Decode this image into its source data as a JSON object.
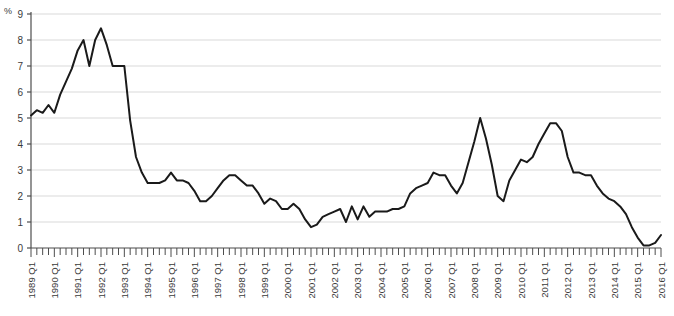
{
  "axis_unit": "%",
  "chart_data": {
    "type": "line",
    "title": "",
    "subtitle": "",
    "xlabel": "",
    "ylabel": "%",
    "ylim": [
      0,
      9
    ],
    "y_ticks": [
      0,
      1,
      2,
      3,
      4,
      5,
      6,
      7,
      8,
      9
    ],
    "grid": true,
    "legend": "none",
    "line_color": "#1a1a1a",
    "grid_color": "#d9d9d9",
    "axis_color": "#4d4d4d",
    "x_tick_labels": [
      "1989 Q1",
      "1990 Q1",
      "1991 Q1",
      "1992 Q1",
      "1993 Q1",
      "1994 Q1",
      "1995 Q1",
      "1996 Q1",
      "1997 Q1",
      "1998 Q1",
      "1999 Q1",
      "2000 Q1",
      "2001 Q1",
      "2002 Q1",
      "2003 Q1",
      "2004 Q1",
      "2005 Q1",
      "2006 Q1",
      "2007 Q1",
      "2008 Q1",
      "2009 Q1",
      "2010 Q1",
      "2011 Q1",
      "2012 Q1",
      "2013 Q1",
      "2014 Q1",
      "2015 Q1",
      "2016 Q1"
    ],
    "x_label_rotation": -90,
    "x_period": "quarterly",
    "x_start": "1989 Q1",
    "x_end": "2016 Q1",
    "x": [
      "1989 Q1",
      "1989 Q2",
      "1989 Q3",
      "1989 Q4",
      "1990 Q1",
      "1990 Q2",
      "1990 Q3",
      "1990 Q4",
      "1991 Q1",
      "1991 Q2",
      "1991 Q3",
      "1991 Q4",
      "1992 Q1",
      "1992 Q2",
      "1992 Q3",
      "1992 Q4",
      "1993 Q1",
      "1993 Q2",
      "1993 Q3",
      "1993 Q4",
      "1994 Q1",
      "1994 Q2",
      "1994 Q3",
      "1994 Q4",
      "1995 Q1",
      "1995 Q2",
      "1995 Q3",
      "1995 Q4",
      "1996 Q1",
      "1996 Q2",
      "1996 Q3",
      "1996 Q4",
      "1997 Q1",
      "1997 Q2",
      "1997 Q3",
      "1997 Q4",
      "1998 Q1",
      "1998 Q2",
      "1998 Q3",
      "1998 Q4",
      "1999 Q1",
      "1999 Q2",
      "1999 Q3",
      "1999 Q4",
      "2000 Q1",
      "2000 Q2",
      "2000 Q3",
      "2000 Q4",
      "2001 Q1",
      "2001 Q2",
      "2001 Q3",
      "2001 Q4",
      "2002 Q1",
      "2002 Q2",
      "2002 Q3",
      "2002 Q4",
      "2003 Q1",
      "2003 Q2",
      "2003 Q3",
      "2003 Q4",
      "2004 Q1",
      "2004 Q2",
      "2004 Q3",
      "2004 Q4",
      "2005 Q1",
      "2005 Q2",
      "2005 Q3",
      "2005 Q4",
      "2006 Q1",
      "2006 Q2",
      "2006 Q3",
      "2006 Q4",
      "2007 Q1",
      "2007 Q2",
      "2007 Q3",
      "2007 Q4",
      "2008 Q1",
      "2008 Q2",
      "2008 Q3",
      "2008 Q4",
      "2009 Q1",
      "2009 Q2",
      "2009 Q3",
      "2009 Q4",
      "2010 Q1",
      "2010 Q2",
      "2010 Q3",
      "2010 Q4",
      "2011 Q1",
      "2011 Q2",
      "2011 Q3",
      "2011 Q4",
      "2012 Q1",
      "2012 Q2",
      "2012 Q3",
      "2012 Q4",
      "2013 Q1",
      "2013 Q2",
      "2013 Q3",
      "2013 Q4",
      "2014 Q1",
      "2014 Q2",
      "2014 Q3",
      "2014 Q4",
      "2015 Q1",
      "2015 Q2",
      "2015 Q3",
      "2015 Q4",
      "2016 Q1"
    ],
    "values": [
      5.1,
      5.3,
      5.2,
      5.5,
      5.2,
      5.9,
      6.4,
      6.9,
      7.6,
      8.0,
      7.0,
      8.0,
      8.45,
      7.8,
      7.0,
      7.0,
      7.0,
      4.9,
      3.5,
      2.9,
      2.5,
      2.5,
      2.5,
      2.6,
      2.9,
      2.6,
      2.6,
      2.5,
      2.2,
      1.8,
      1.8,
      2.0,
      2.3,
      2.6,
      2.8,
      2.8,
      2.6,
      2.4,
      2.4,
      2.1,
      1.7,
      1.9,
      1.8,
      1.5,
      1.5,
      1.7,
      1.5,
      1.1,
      0.8,
      0.9,
      1.2,
      1.3,
      1.4,
      1.5,
      1.0,
      1.6,
      1.1,
      1.6,
      1.2,
      1.4,
      1.4,
      1.4,
      1.5,
      1.5,
      1.6,
      2.1,
      2.3,
      2.4,
      2.5,
      2.9,
      2.8,
      2.8,
      2.4,
      2.1,
      2.5,
      3.3,
      4.1,
      5.0,
      4.2,
      3.2,
      2.0,
      1.8,
      2.6,
      3.0,
      3.4,
      3.3,
      3.5,
      4.0,
      4.4,
      4.8,
      4.8,
      4.5,
      3.5,
      2.9,
      2.9,
      2.8,
      2.8,
      2.4,
      2.1,
      1.9,
      1.8,
      1.6,
      1.3,
      0.8,
      0.4,
      0.1,
      0.1,
      0.2,
      0.5
    ]
  }
}
